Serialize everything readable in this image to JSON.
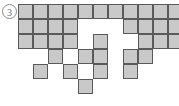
{
  "figure": {
    "label": "3",
    "label_name": "figure-number-badge",
    "type": "polyomino-grid-diagram",
    "colors": {
      "cell_fill": "#c9c9c9",
      "cell_border": "#5a5a5a",
      "background": "#ffffff",
      "badge_stroke": "#8a8a8a",
      "badge_text": "#6e6e6e"
    },
    "grid": {
      "origin_x": 18,
      "origin_y": 4,
      "cell_size": 15,
      "columns": 11,
      "rows": 6
    },
    "cells": [
      {
        "c": 0,
        "r": 0
      },
      {
        "c": 1,
        "r": 0
      },
      {
        "c": 2,
        "r": 0
      },
      {
        "c": 3,
        "r": 0
      },
      {
        "c": 4,
        "r": 0
      },
      {
        "c": 5,
        "r": 0
      },
      {
        "c": 6,
        "r": 0
      },
      {
        "c": 7,
        "r": 0
      },
      {
        "c": 8,
        "r": 0
      },
      {
        "c": 9,
        "r": 0
      },
      {
        "c": 10,
        "r": 0
      },
      {
        "c": 0,
        "r": 1
      },
      {
        "c": 1,
        "r": 1
      },
      {
        "c": 2,
        "r": 1
      },
      {
        "c": 3,
        "r": 1
      },
      {
        "c": 7,
        "r": 1
      },
      {
        "c": 8,
        "r": 1
      },
      {
        "c": 9,
        "r": 1
      },
      {
        "c": 10,
        "r": 1
      },
      {
        "c": 0,
        "r": 2
      },
      {
        "c": 1,
        "r": 2
      },
      {
        "c": 2,
        "r": 2
      },
      {
        "c": 3,
        "r": 2
      },
      {
        "c": 5,
        "r": 2
      },
      {
        "c": 8,
        "r": 2
      },
      {
        "c": 9,
        "r": 2
      },
      {
        "c": 10,
        "r": 2
      },
      {
        "c": 2,
        "r": 3
      },
      {
        "c": 4,
        "r": 3
      },
      {
        "c": 5,
        "r": 3
      },
      {
        "c": 7,
        "r": 3
      },
      {
        "c": 8,
        "r": 3
      },
      {
        "c": 1,
        "r": 4
      },
      {
        "c": 3,
        "r": 4
      },
      {
        "c": 5,
        "r": 4
      },
      {
        "c": 7,
        "r": 4
      },
      {
        "c": 4,
        "r": 5
      }
    ]
  }
}
